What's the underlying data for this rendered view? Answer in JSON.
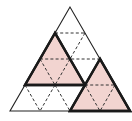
{
  "figure": {
    "grid_side_units": 4,
    "colors": {
      "shade": "#f2d4d0",
      "stroke": "#1a1a1a",
      "background": "#ffffff"
    },
    "outer_triangle": {
      "points": "70,7 10,111 130,111"
    },
    "shaded_triangles": [
      {
        "id": "left-shaded",
        "points": "55,33 25,85 85,85"
      },
      {
        "id": "right-shaded",
        "points": "100,59 70,111 130,111"
      }
    ],
    "dashed_lines": [
      {
        "x1": 55,
        "y1": 33,
        "x2": 85,
        "y2": 33
      },
      {
        "x1": 85,
        "y1": 33,
        "x2": 70,
        "y2": 59
      },
      {
        "x1": 40,
        "y1": 59,
        "x2": 100,
        "y2": 59
      },
      {
        "x1": 40,
        "y1": 59,
        "x2": 55,
        "y2": 85
      },
      {
        "x1": 70,
        "y1": 59,
        "x2": 55,
        "y2": 85
      },
      {
        "x1": 25,
        "y1": 85,
        "x2": 40,
        "y2": 111
      },
      {
        "x1": 55,
        "y1": 85,
        "x2": 40,
        "y2": 111
      },
      {
        "x1": 55,
        "y1": 85,
        "x2": 70,
        "y2": 111
      },
      {
        "x1": 85,
        "y1": 85,
        "x2": 115,
        "y2": 85
      },
      {
        "x1": 85,
        "y1": 85,
        "x2": 100,
        "y2": 111
      },
      {
        "x1": 115,
        "y1": 85,
        "x2": 100,
        "y2": 111
      }
    ]
  }
}
